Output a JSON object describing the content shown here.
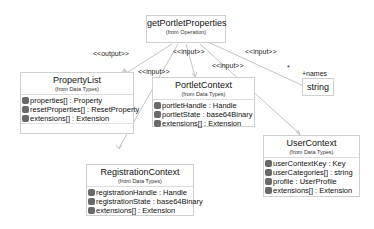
{
  "operation": {
    "name": "getPortletProperties",
    "stereotype": "(from Operation)"
  },
  "classes": {
    "property_list": {
      "name": "PropertyList",
      "from": "(from Data Types)",
      "attributes": [
        "properties[] : Property",
        "resetProperties[] : ResetProperty",
        "extensions[] : Extension"
      ]
    },
    "portlet_context": {
      "name": "PortletContext",
      "from": "(from Data Types)",
      "attributes": [
        "portletHandle : Handle",
        "portletState : base64Binary",
        "extensions[] : Extension"
      ]
    },
    "registration_context": {
      "name": "RegistrationContext",
      "from": "(from Data Types)",
      "attributes": [
        "registrationHandle : Handle",
        "registrationState : base64Binary",
        "extensions[] : Extension"
      ]
    },
    "user_context": {
      "name": "UserContext",
      "from": "(from Data Types)",
      "attributes": [
        "userContextKey : Key",
        "userCategories[] : string",
        "profile : UserProfile",
        "extensions[] : Extension"
      ]
    },
    "string_type": {
      "name": "string"
    }
  },
  "relations": {
    "output": "<<output>>",
    "input_registration": "<<input>>",
    "input_portlet": "<<input>>",
    "input_user": "<<input>>",
    "input_names": "<<input>>",
    "multiplicity": "*",
    "role_names": "+names"
  }
}
